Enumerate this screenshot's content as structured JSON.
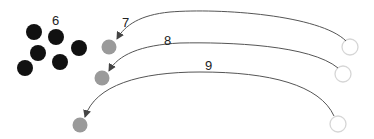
{
  "labels": {
    "group": "6",
    "arrow1": "7",
    "arrow2": "8",
    "arrow3": "9"
  },
  "colors": {
    "black_dot": "#111111",
    "gray_dot": "#9a9a9a",
    "hollow_stroke": "#d8d8d8",
    "arrow": "#555555"
  }
}
